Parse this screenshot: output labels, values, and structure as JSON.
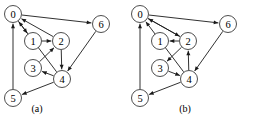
{
  "figure": {
    "type": "directed-graph-pair",
    "background_color": "#ffffff",
    "node_fill": "#ffffff",
    "node_stroke": "#3a3a3a",
    "edge_color": "#1a1a1a"
  },
  "panels": [
    {
      "id": "a",
      "caption": "(a)",
      "caption_pos": {
        "x": 37,
        "y": 112
      },
      "nodes": [
        {
          "id": "0",
          "label": "0",
          "x": 13,
          "y": 14,
          "r": 8.5
        },
        {
          "id": "1",
          "label": "1",
          "x": 33,
          "y": 41,
          "r": 8.5
        },
        {
          "id": "2",
          "label": "2",
          "x": 61,
          "y": 41,
          "r": 8.5
        },
        {
          "id": "6",
          "label": "6",
          "x": 101,
          "y": 24,
          "r": 8.5
        },
        {
          "id": "3",
          "label": "3",
          "x": 33,
          "y": 68,
          "r": 8.5
        },
        {
          "id": "4",
          "label": "4",
          "x": 62,
          "y": 79,
          "r": 8.5
        },
        {
          "id": "5",
          "label": "5",
          "x": 13,
          "y": 98,
          "r": 8.5
        }
      ],
      "edges": [
        {
          "from": "0",
          "to": "1"
        },
        {
          "from": "0",
          "to": "6"
        },
        {
          "from": "1",
          "to": "2"
        },
        {
          "from": "2",
          "to": "0"
        },
        {
          "from": "2",
          "to": "4"
        },
        {
          "from": "3",
          "to": "2"
        },
        {
          "from": "4",
          "to": "0"
        },
        {
          "from": "4",
          "to": "3"
        },
        {
          "from": "4",
          "to": "5"
        },
        {
          "from": "5",
          "to": "0"
        },
        {
          "from": "6",
          "to": "4"
        }
      ]
    },
    {
      "id": "b",
      "caption": "(b)",
      "caption_pos": {
        "x": 58,
        "y": 112
      },
      "nodes": [
        {
          "id": "0",
          "label": "0",
          "x": 13,
          "y": 14,
          "r": 8.5
        },
        {
          "id": "1",
          "label": "1",
          "x": 33,
          "y": 41,
          "r": 8.5
        },
        {
          "id": "2",
          "label": "2",
          "x": 61,
          "y": 41,
          "r": 8.5
        },
        {
          "id": "6",
          "label": "6",
          "x": 101,
          "y": 24,
          "r": 8.5
        },
        {
          "id": "3",
          "label": "3",
          "x": 33,
          "y": 68,
          "r": 8.5
        },
        {
          "id": "4",
          "label": "4",
          "x": 62,
          "y": 79,
          "r": 8.5
        },
        {
          "id": "5",
          "label": "5",
          "x": 13,
          "y": 98,
          "r": 8.5
        }
      ],
      "edges": [
        {
          "from": "0",
          "to": "2"
        },
        {
          "from": "0",
          "to": "6"
        },
        {
          "from": "2",
          "to": "1"
        },
        {
          "from": "2",
          "to": "0"
        },
        {
          "from": "2",
          "to": "3"
        },
        {
          "from": "3",
          "to": "4"
        },
        {
          "from": "4",
          "to": "0"
        },
        {
          "from": "4",
          "to": "2"
        },
        {
          "from": "4",
          "to": "5"
        },
        {
          "from": "5",
          "to": "0"
        },
        {
          "from": "6",
          "to": "4"
        }
      ]
    }
  ]
}
